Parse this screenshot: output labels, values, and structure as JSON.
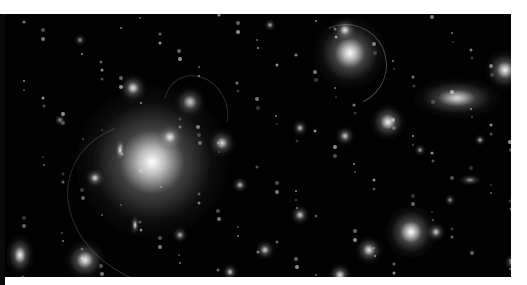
{
  "image": {
    "subject": "galaxy cluster deep field",
    "palette": {
      "background": "#020202",
      "glow": "#ffffff",
      "border": "#ffffff"
    },
    "galaxies": [
      {
        "x": 152,
        "y": 162,
        "r": 38,
        "b": 1.0
      },
      {
        "x": 120,
        "y": 150,
        "r": 6,
        "b": 0.9,
        "sx": 0.45
      },
      {
        "x": 170,
        "y": 137,
        "r": 7,
        "b": 0.9
      },
      {
        "x": 222,
        "y": 143,
        "r": 7,
        "b": 0.85
      },
      {
        "x": 190,
        "y": 102,
        "r": 8,
        "b": 0.8
      },
      {
        "x": 133,
        "y": 88,
        "r": 7,
        "b": 0.9
      },
      {
        "x": 350,
        "y": 53,
        "r": 18,
        "b": 1.0
      },
      {
        "x": 345,
        "y": 30,
        "r": 6,
        "b": 0.9
      },
      {
        "x": 388,
        "y": 122,
        "r": 9,
        "b": 0.95
      },
      {
        "x": 457,
        "y": 98,
        "r": 10,
        "b": 0.85,
        "sx": 2.2
      },
      {
        "x": 505,
        "y": 70,
        "r": 10,
        "b": 0.95
      },
      {
        "x": 411,
        "y": 232,
        "r": 13,
        "b": 1.0
      },
      {
        "x": 436,
        "y": 232,
        "r": 5,
        "b": 0.8
      },
      {
        "x": 369,
        "y": 250,
        "r": 7,
        "b": 0.9
      },
      {
        "x": 85,
        "y": 260,
        "r": 10,
        "b": 0.95
      },
      {
        "x": 20,
        "y": 255,
        "r": 10,
        "b": 0.95,
        "sx": 0.7
      },
      {
        "x": 135,
        "y": 225,
        "r": 5,
        "b": 0.9,
        "sx": 0.45
      },
      {
        "x": 95,
        "y": 178,
        "r": 5,
        "b": 0.85
      },
      {
        "x": 345,
        "y": 136,
        "r": 5,
        "b": 0.8
      },
      {
        "x": 300,
        "y": 215,
        "r": 5,
        "b": 0.8
      },
      {
        "x": 240,
        "y": 185,
        "r": 4,
        "b": 0.75
      },
      {
        "x": 265,
        "y": 250,
        "r": 5,
        "b": 0.8
      },
      {
        "x": 230,
        "y": 272,
        "r": 4,
        "b": 0.8
      },
      {
        "x": 340,
        "y": 275,
        "r": 6,
        "b": 0.85
      },
      {
        "x": 480,
        "y": 140,
        "r": 3,
        "b": 0.7
      },
      {
        "x": 512,
        "y": 262,
        "r": 4,
        "b": 0.7
      },
      {
        "x": 60,
        "y": 120,
        "r": 3,
        "b": 0.6
      },
      {
        "x": 180,
        "y": 235,
        "r": 4,
        "b": 0.7
      },
      {
        "x": 270,
        "y": 25,
        "r": 3,
        "b": 0.7
      },
      {
        "x": 420,
        "y": 150,
        "r": 3,
        "b": 0.65
      },
      {
        "x": 300,
        "y": 128,
        "r": 4,
        "b": 0.75
      },
      {
        "x": 80,
        "y": 40,
        "r": 3,
        "b": 0.6
      },
      {
        "x": 450,
        "y": 200,
        "r": 3,
        "b": 0.6
      },
      {
        "x": 470,
        "y": 180,
        "r": 3,
        "b": 0.6,
        "sx": 2
      }
    ]
  }
}
